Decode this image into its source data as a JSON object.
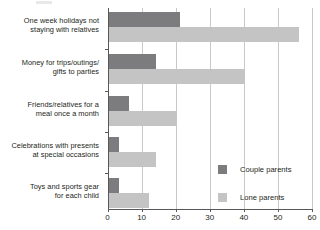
{
  "chart_data": {
    "type": "bar",
    "orientation": "horizontal",
    "title": "",
    "xlabel": "",
    "ylabel": "",
    "xlim": [
      0,
      60
    ],
    "xticks": [
      0,
      10,
      20,
      30,
      40,
      50,
      60
    ],
    "grid": true,
    "legend_position": "inside-bottom-right",
    "categories": [
      "One week holidays not staying with relatives",
      "Money for trips/outings/ gifts to parties",
      "Friends/relatives for a meal once a month",
      "Celebrations with presents at special occasions",
      "Toys and sports gear for each child"
    ],
    "series": [
      {
        "name": "Couple parents",
        "color": "#7c7c7e",
        "values": [
          21,
          14,
          6,
          3,
          3
        ]
      },
      {
        "name": "Lone parents",
        "color": "#c4c4c4",
        "values": [
          56,
          40,
          20,
          14,
          12
        ]
      }
    ]
  },
  "axis": {
    "tick_labels": [
      "0",
      "10",
      "20",
      "30",
      "40",
      "50",
      "60"
    ]
  },
  "categories": [
    {
      "line1": "One week holidays not",
      "line2": "staying with relatives"
    },
    {
      "line1": "Money for trips/outings/",
      "line2": "gifts to parties"
    },
    {
      "line1": "Friends/relatives for a",
      "line2": "meal once a month"
    },
    {
      "line1": "Celebrations with presents",
      "line2": "at special occasions"
    },
    {
      "line1": "Toys and sports gear",
      "line2": "for each child"
    }
  ],
  "legend": {
    "items": [
      {
        "label": "Couple parents"
      },
      {
        "label": "Lone parents"
      }
    ]
  }
}
